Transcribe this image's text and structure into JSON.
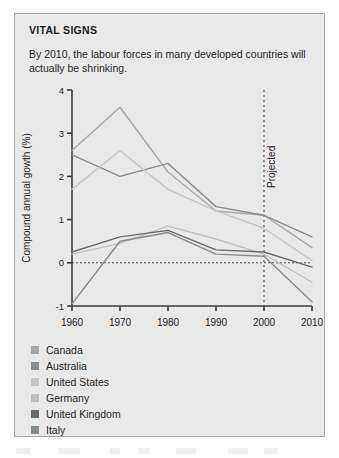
{
  "panel": {
    "title": "VITAL SIGNS",
    "subtitle": "By 2010, the labour forces in many developed countries will actually be shrinking.",
    "background_color": "#e9e9e9",
    "border_color": "#a9a9a9"
  },
  "chart_data": {
    "type": "line",
    "title": "VITAL SIGNS",
    "subtitle": "By 2010, the labour forces in many developed countries will actually be shrinking.",
    "xlabel": "",
    "ylabel": "Compound annual gowth (%)",
    "x": [
      1960,
      1970,
      1980,
      1990,
      2000,
      2010
    ],
    "categories": [
      "1960",
      "1970",
      "1980",
      "1990",
      "2000",
      "2010"
    ],
    "xlim": [
      1960,
      2010
    ],
    "ylim": [
      -1,
      4
    ],
    "yticks": [
      -1,
      0,
      1,
      2,
      3,
      4
    ],
    "ytick_labels": [
      "-1",
      "0",
      "1",
      "2",
      "3",
      "4"
    ],
    "grid": false,
    "zero_line": true,
    "legend_position": "below",
    "annotations": [
      {
        "text": "Projected",
        "x": 2000,
        "orientation": "vertical",
        "style": "dashed-vertical-line"
      }
    ],
    "series": [
      {
        "name": "Canada",
        "color": "#a8a8a8",
        "values": [
          2.6,
          3.6,
          2.1,
          1.2,
          1.1,
          0.35
        ]
      },
      {
        "name": "Australia",
        "color": "#8c8c8c",
        "values": [
          2.5,
          2.0,
          2.3,
          1.3,
          1.1,
          0.6
        ]
      },
      {
        "name": "United States",
        "color": "#c6c6c6",
        "values": [
          1.7,
          2.6,
          1.7,
          1.2,
          0.8,
          0.05
        ]
      },
      {
        "name": "Germany",
        "color": "#c0c0c0",
        "values": [
          0.2,
          0.45,
          0.85,
          0.55,
          0.2,
          -0.45
        ]
      },
      {
        "name": "United Kingdom",
        "color": "#6b6b6b",
        "values": [
          0.25,
          0.6,
          0.75,
          0.3,
          0.25,
          -0.1
        ]
      },
      {
        "name": "Italy",
        "color": "#8a8a8a",
        "values": [
          -0.95,
          0.5,
          0.7,
          0.2,
          0.15,
          -0.9
        ]
      }
    ]
  },
  "legend": {
    "items": [
      {
        "label": "Canada",
        "color": "#a8a8a8"
      },
      {
        "label": "Australia",
        "color": "#8c8c8c"
      },
      {
        "label": "United States",
        "color": "#c6c6c6"
      },
      {
        "label": "Germany",
        "color": "#c0c0c0"
      },
      {
        "label": "United Kingdom",
        "color": "#6b6b6b"
      },
      {
        "label": "Italy",
        "color": "#8a8a8a"
      }
    ]
  }
}
